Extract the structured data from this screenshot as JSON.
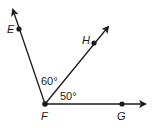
{
  "diagram": {
    "vertex": {
      "label": "F",
      "x": 45,
      "y": 104
    },
    "rays": [
      {
        "name": "FE",
        "point_label": "E",
        "point": [
          19,
          29
        ],
        "tip": [
          13,
          9
        ]
      },
      {
        "name": "FH",
        "point_label": "H",
        "point": [
          94,
          43
        ],
        "tip": [
          109,
          26
        ]
      },
      {
        "name": "FG",
        "point_label": "G",
        "point": [
          122,
          104
        ],
        "tip": [
          146,
          104
        ]
      }
    ],
    "angles": [
      {
        "between": "EFH",
        "label": "60°"
      },
      {
        "between": "HFG",
        "label": "50°"
      }
    ],
    "labels": {
      "E": "E",
      "H": "H",
      "F": "F",
      "G": "G",
      "angle_efh": "60°",
      "angle_hfg": "50°"
    },
    "colors": {
      "stroke": "#1a1a1a",
      "background": "#ffffff"
    }
  }
}
